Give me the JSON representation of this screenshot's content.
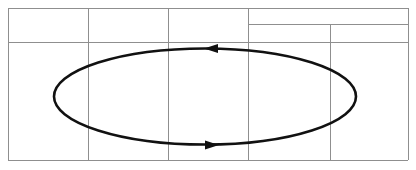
{
  "figure": {
    "width": 416,
    "height": 170,
    "background_color": "#ffffff"
  },
  "grid": {
    "name": "cell-grid",
    "line_color": "#8f8f8f",
    "line_width": 1,
    "frame": {
      "x1": 8,
      "y1": 8,
      "x2": 408,
      "y2": 160
    },
    "vertical_lines": [
      {
        "id": "v-left-border",
        "x": 8,
        "y1": 8,
        "y2": 160
      },
      {
        "id": "v-col-1",
        "x": 88,
        "y1": 8,
        "y2": 160
      },
      {
        "id": "v-col-2",
        "x": 168,
        "y1": 8,
        "y2": 160
      },
      {
        "id": "v-col-3",
        "x": 248,
        "y1": 8,
        "y2": 160
      },
      {
        "id": "v-col-4",
        "x": 330,
        "y1": 24,
        "y2": 160
      },
      {
        "id": "v-right-border",
        "x": 408,
        "y1": 8,
        "y2": 160
      }
    ],
    "horizontal_lines": [
      {
        "id": "h-top-border",
        "y": 8,
        "x1": 8,
        "x2": 408
      },
      {
        "id": "h-upper-split-right",
        "y": 24,
        "x1": 248,
        "x2": 408
      },
      {
        "id": "h-row-1",
        "y": 42,
        "x1": 8,
        "x2": 408
      },
      {
        "id": "h-bottom-border",
        "y": 160,
        "x1": 8,
        "x2": 408
      }
    ]
  },
  "chart_data": {
    "type": "diagram",
    "shape": "ellipse",
    "stroke_color": "#111111",
    "stroke_width": 2.6,
    "ellipse": {
      "cx": 205,
      "cy": 96.5,
      "rx": 151,
      "ry": 48
    },
    "direction": "counterclockwise",
    "arrows": [
      {
        "id": "arrow-top",
        "label": "top-flow-arrow",
        "points": "left",
        "tip_x": 204,
        "tip_y": 48.5,
        "length": 14,
        "half_width": 4.5
      },
      {
        "id": "arrow-bottom",
        "label": "bottom-flow-arrow",
        "points": "right",
        "tip_x": 219,
        "tip_y": 145,
        "length": 14,
        "half_width": 4.5
      }
    ]
  }
}
